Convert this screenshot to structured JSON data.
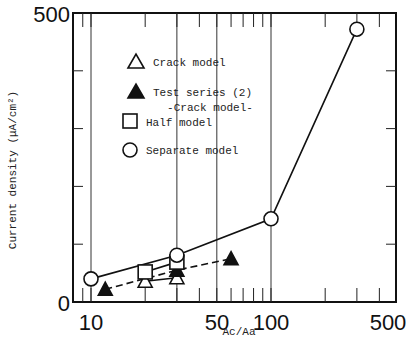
{
  "chart_data": {
    "type": "line",
    "title": "",
    "xlabel": "Ac/Aa",
    "ylabel": "Current density (μA/cm²)",
    "xscale": "log",
    "xlim": [
      8,
      500
    ],
    "ylim": [
      0,
      500
    ],
    "x_tick_labels": [
      "10",
      "50",
      "100",
      "500"
    ],
    "y_tick_labels": [
      "0",
      "500"
    ],
    "y_minor_ticks": [
      100,
      200,
      300,
      400
    ],
    "x_minor_ticks": [
      9,
      20,
      30,
      40,
      60,
      70,
      80,
      90,
      200,
      300,
      400
    ],
    "grid_lines_x": [
      10,
      30,
      50,
      100
    ],
    "annotation": "-Crack model-",
    "legend_position": "upper-left",
    "series": [
      {
        "name": "Crack model",
        "marker": "triangle-open",
        "line": "solid",
        "x": [
          20,
          30
        ],
        "y": [
          36,
          42
        ]
      },
      {
        "name": "Test series (2)",
        "marker": "triangle-filled",
        "line": "dashed",
        "x": [
          12,
          30,
          60
        ],
        "y": [
          22,
          55,
          75
        ]
      },
      {
        "name": "Half model",
        "marker": "square-open",
        "line": "solid",
        "x": [
          20,
          30
        ],
        "y": [
          52,
          69
        ]
      },
      {
        "name": "Separate model",
        "marker": "circle-open",
        "line": "solid",
        "x": [
          10,
          30,
          100,
          300
        ],
        "y": [
          40,
          81,
          144,
          472
        ]
      }
    ]
  },
  "legend": {
    "items": [
      {
        "label": "Crack model"
      },
      {
        "label": "Test series (2)"
      },
      {
        "label": "Half model"
      },
      {
        "label": "Separate model"
      }
    ]
  },
  "axes": {
    "x_label": "Ac/Aa",
    "y_label": "Current density (μA/cm²)",
    "y_top": "500",
    "y_zero": "0",
    "x_ticks": {
      "t10": "10",
      "t50": "50",
      "t100": "100",
      "t500": "500"
    }
  },
  "annotation": "-Crack model-"
}
